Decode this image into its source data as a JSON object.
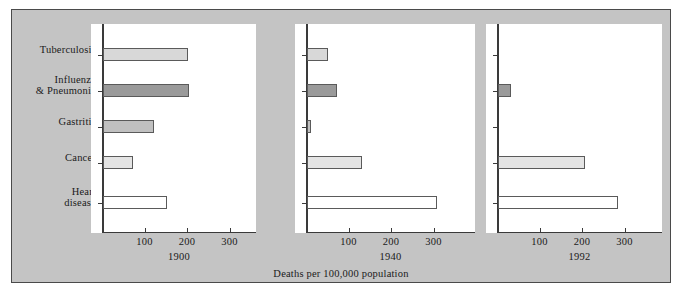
{
  "figure": {
    "caption": "Deaths per 100,000 population",
    "background_color": "#c4c4c4",
    "panel_background_color": "#ffffff",
    "frame_border_color": "#4a4a4a"
  },
  "categories": [
    "Tuberculosis",
    "Influenza\n& Pneumonia",
    "Gastritis",
    "Cancer",
    "Heart\ndisease"
  ],
  "category_labels": [
    {
      "line1": "Tuberculosis",
      "line2": ""
    },
    {
      "line1": "Influenza",
      "line2": "& Pneumonia"
    },
    {
      "line1": "Gastritis",
      "line2": ""
    },
    {
      "line1": "Cancer",
      "line2": ""
    },
    {
      "line1": "Heart",
      "line2": "disease"
    }
  ],
  "axis": {
    "ticks": [
      100,
      200,
      300
    ],
    "tick_labels": [
      "100",
      "200",
      "300"
    ],
    "xmin": 0,
    "xmax": 350
  },
  "panels": [
    {
      "year": "1900"
    },
    {
      "year": "1940"
    },
    {
      "year": "1992"
    }
  ],
  "bar_colors": {
    "Tuberculosis": "#d8d8d8",
    "Influenza & Pneumonia": "#9a9a9a",
    "Gastritis": "#c0c0c0",
    "Cancer": "#e4e4e4",
    "Heart disease": "#ffffff"
  },
  "chart_data": {
    "type": "bar",
    "title": "",
    "subtitle": "",
    "xlabel": "Deaths per 100,000 population",
    "ylabel": "",
    "orientation": "horizontal",
    "grid": false,
    "legend": "none",
    "xlim": [
      0,
      350
    ],
    "xticks": [
      100,
      200,
      300
    ],
    "categories": [
      "Tuberculosis",
      "Influenza & Pneumonia",
      "Gastritis",
      "Cancer",
      "Heart disease"
    ],
    "panels": [
      "1900",
      "1940",
      "1992"
    ],
    "series": [
      {
        "name": "1900",
        "values": [
          200,
          202,
          120,
          70,
          150
        ]
      },
      {
        "name": "1940",
        "values": [
          50,
          70,
          10,
          130,
          305
        ]
      },
      {
        "name": "1992",
        "values": [
          0,
          30,
          0,
          205,
          282
        ]
      }
    ],
    "annotations": [
      "Deaths per 100,000 population"
    ]
  }
}
